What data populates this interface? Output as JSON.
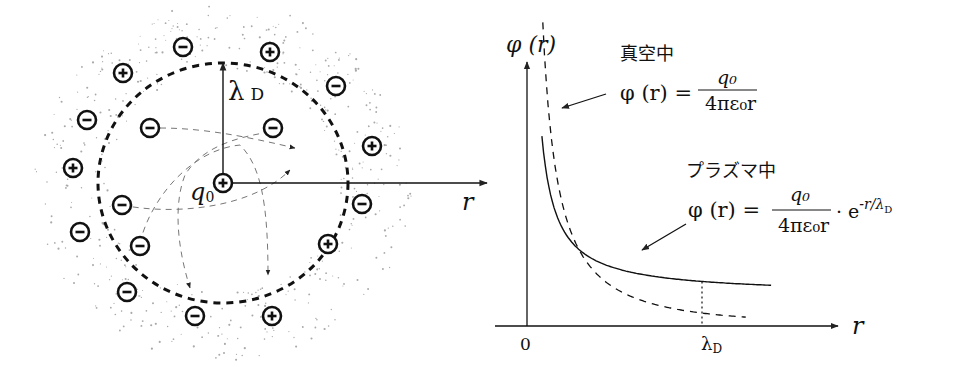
{
  "left_diagram": {
    "title": "Debye shielding schematic",
    "central_charge": {
      "label": "q",
      "subscript": "0",
      "sign": "+"
    },
    "radius_label": {
      "symbol": "λ",
      "subscript": "D"
    },
    "axis_label": "r",
    "boundary": "dashed circle of radius λD",
    "ions": [
      {
        "sign": "-",
        "region": "outer"
      },
      {
        "sign": "+",
        "region": "outer"
      },
      {
        "sign": "+",
        "region": "outer"
      },
      {
        "sign": "-",
        "region": "outer"
      },
      {
        "sign": "-",
        "region": "outer"
      },
      {
        "sign": "+",
        "region": "outer"
      },
      {
        "sign": "+",
        "region": "outer"
      },
      {
        "sign": "-",
        "region": "outer"
      },
      {
        "sign": "-",
        "region": "outer"
      },
      {
        "sign": "+",
        "region": "outer"
      },
      {
        "sign": "-",
        "region": "outer"
      },
      {
        "sign": "-",
        "region": "outer"
      },
      {
        "sign": "+",
        "region": "outer"
      },
      {
        "sign": "+",
        "region": "outer"
      },
      {
        "sign": "-",
        "region": "outer"
      },
      {
        "sign": "-",
        "region": "inner"
      },
      {
        "sign": "-",
        "region": "inner"
      },
      {
        "sign": "-",
        "region": "inner"
      },
      {
        "sign": "-",
        "region": "inner"
      }
    ]
  },
  "right_plot": {
    "y_axis_label": "φ (r)",
    "x_axis_label": "r",
    "origin_label": "0",
    "x_tick_label": {
      "symbol": "λ",
      "subscript": "D"
    },
    "vacuum": {
      "title": "真空中",
      "formula_lhs": "φ (r) =",
      "numerator": "q₀",
      "denominator": "4πε₀r"
    },
    "plasma": {
      "title": "プラズマ中",
      "formula_lhs": "φ (r) =",
      "numerator": "q₀",
      "denominator": "4πε₀r",
      "factor_dot": "·",
      "factor": "e",
      "exponent": "-r/λ",
      "exponent_sub": "D"
    }
  },
  "chart_data": {
    "type": "line",
    "title": "",
    "xlabel": "r",
    "ylabel": "φ(r)",
    "x_ticks": [
      "0",
      "λD"
    ],
    "lambda_D": 1.0,
    "xlim": [
      0,
      1.7
    ],
    "series": [
      {
        "name": "真空中 φ(r) = q0/(4πε0 r)",
        "style": "solid",
        "x": [
          0.08,
          0.2,
          0.4,
          0.6,
          0.8,
          1.0,
          1.2,
          1.4
        ],
        "formula": "1/r"
      },
      {
        "name": "プラズマ中 φ(r) = q0/(4πε0 r)·e^(-r/λD)",
        "style": "dashed",
        "x": [
          0.08,
          0.2,
          0.4,
          0.6,
          0.8,
          1.0,
          1.2,
          1.25
        ],
        "formula": "exp(-r)/r"
      }
    ],
    "annotations": [
      "dotted vertical line at r = λD"
    ]
  }
}
